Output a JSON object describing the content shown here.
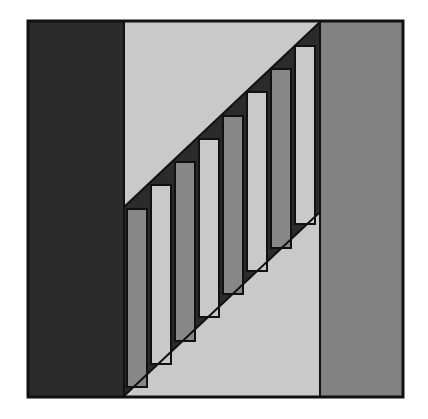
{
  "artwork": {
    "title": "Geometric Abstract Composition",
    "type": "abstract-geometric-figure",
    "canvas": {
      "width": 428,
      "height": 419,
      "background": "#ffffff"
    },
    "palette": {
      "outline": "#111111",
      "frame_stroke": "#111111",
      "dark_panel": "#2b2b2b",
      "dark_band": "#2b2b2b",
      "mid_gray": "#878787",
      "light_gray": "#c9c9c9",
      "right_gray": "#818181",
      "white_paper": "#ffffff"
    },
    "frame": {
      "label": "outer-frame",
      "x": 28,
      "y": 21,
      "width": 375,
      "height": 376,
      "stroke_width": 3,
      "stroke": "#111111"
    },
    "panels": [
      {
        "name": "left-dark-panel",
        "fill": "#2b2b2b",
        "x": 29,
        "y": 22,
        "width": 95,
        "height": 374
      },
      {
        "name": "center-band",
        "fill": "#c9c9c9",
        "x": 124,
        "y": 22,
        "width": 196,
        "height": 374
      },
      {
        "name": "right-gray-panel",
        "fill": "#818181",
        "x": 320,
        "y": 22,
        "width": 82,
        "height": 374
      }
    ],
    "diagonal_band": {
      "name": "dark-diagonal-band",
      "fill": "#2b2b2b",
      "description": "Dark band running from lower-left to upper-right across the center panel",
      "upper_edge": {
        "x1": 124,
        "y1": 207,
        "x2": 320,
        "y2": 22
      },
      "lower_edge": {
        "x1": 124,
        "y1": 396,
        "x2": 320,
        "y2": 212
      }
    },
    "bars": {
      "count": 8,
      "description": "Vertical bars stepping upward left to right, alternating mid-gray and light-gray fills",
      "stroke": "#111111",
      "stroke_width": 2,
      "items": [
        {
          "index": 1,
          "fill": "#878787",
          "x": 127,
          "width": 20,
          "top": 209,
          "bottom": 387
        },
        {
          "index": 2,
          "fill": "#c9c9c9",
          "x": 151,
          "width": 20,
          "top": 185,
          "bottom": 364
        },
        {
          "index": 3,
          "fill": "#878787",
          "x": 175,
          "width": 20,
          "top": 162,
          "bottom": 341
        },
        {
          "index": 4,
          "fill": "#c9c9c9",
          "x": 199,
          "width": 20,
          "top": 139,
          "bottom": 317
        },
        {
          "index": 5,
          "fill": "#878787",
          "x": 223,
          "width": 20,
          "top": 116,
          "bottom": 294
        },
        {
          "index": 6,
          "fill": "#c9c9c9",
          "x": 247,
          "width": 20,
          "top": 92,
          "bottom": 271
        },
        {
          "index": 7,
          "fill": "#878787",
          "x": 271,
          "width": 20,
          "top": 69,
          "bottom": 248
        },
        {
          "index": 8,
          "fill": "#c9c9c9",
          "x": 295,
          "width": 20,
          "top": 46,
          "bottom": 224
        }
      ]
    }
  }
}
